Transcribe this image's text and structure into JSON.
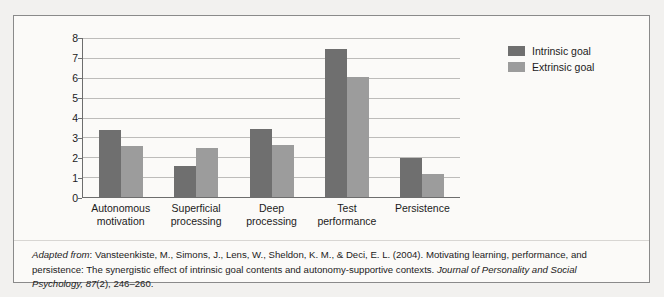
{
  "chart_data": {
    "type": "bar",
    "title": "",
    "subtitle": "",
    "xlabel": "",
    "ylabel": "",
    "categories": [
      "Autonomous\nmotivation",
      "Superficial\nprocessing",
      "Deep\nprocessing",
      "Test\nperformance",
      "Persistence"
    ],
    "category_labels_flat": [
      "Autonomous motivation",
      "Superficial processing",
      "Deep processing",
      "Test performance",
      "Persistence"
    ],
    "series": [
      {
        "name": "Intrinsic goal",
        "color": "#6f6f6f",
        "values": [
          3.35,
          1.55,
          3.4,
          7.45,
          1.95
        ]
      },
      {
        "name": "Extrinsic goal",
        "color": "#9c9c9c",
        "values": [
          2.55,
          2.45,
          2.6,
          6.05,
          1.15
        ]
      }
    ],
    "ylim": [
      0,
      8
    ],
    "ytick_labels": [
      "0",
      "1",
      "2",
      "3",
      "4",
      "5",
      "6",
      "7",
      "8"
    ],
    "ytick_values": [
      0,
      1,
      2,
      3,
      4,
      5,
      6,
      7,
      8
    ],
    "grid": "horizontal",
    "legend_position": "top-right-outside",
    "annotations": []
  },
  "legend": {
    "entries": [
      {
        "label": "Intrinsic goal",
        "swatch": "legend-swatch-intrinsic"
      },
      {
        "label": "Extrinsic goal",
        "swatch": "legend-swatch-extrinsic"
      }
    ]
  },
  "caption": {
    "lead_italic": "Adapted from",
    "segment_1": ": Vansteenkiste, M., Simons, J., Lens, W., Sheldon, K. M., & Deci, E. L. (2004). Motivating learning, performance, and persistence: The synergistic effect of intrinsic goal contents and autonomy-supportive contexts. ",
    "journal_italic": "Journal of Personality and Social Psychology, 87",
    "segment_2": "(2), 246–260."
  }
}
